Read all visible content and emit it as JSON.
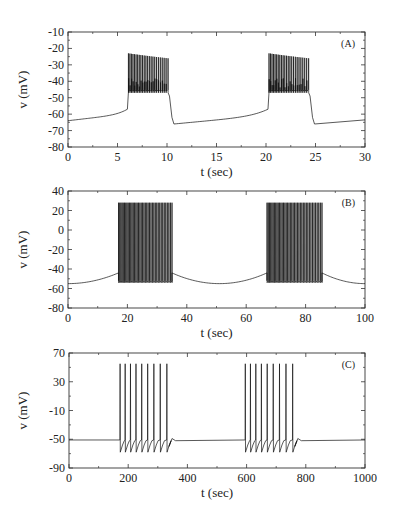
{
  "chart_data": [
    {
      "type": "line",
      "panel_label": "(A)",
      "xlabel": "t (sec)",
      "ylabel": "v (mV)",
      "xlim": [
        0,
        30
      ],
      "ylim": [
        -80,
        -10
      ],
      "xticks": [
        0,
        5,
        10,
        15,
        20,
        25,
        30
      ],
      "yticks": [
        -10,
        -20,
        -30,
        -40,
        -50,
        -60,
        -70,
        -80
      ],
      "grid": false,
      "description": "Bursting membrane potential: slow ramp from -64 mV, bursts of spikes (peaks ~-23 to -26 mV, troughs ~-47 mV) then drop to -66 mV",
      "bursts": [
        {
          "start": 6.1,
          "end": 10.1,
          "spikes": 24,
          "peak": -23,
          "trough": -47
        },
        {
          "start": 20.3,
          "end": 24.3,
          "spikes": 24,
          "peak": -23,
          "trough": -47
        }
      ],
      "baseline": {
        "start_v": -64,
        "post_burst_v": -66,
        "pre_burst_v": -59
      },
      "plot_box": {
        "x0": 68,
        "x1": 365,
        "y0": 32,
        "y1": 147
      }
    },
    {
      "type": "line",
      "panel_label": "(B)",
      "xlabel": "t (sec)",
      "ylabel": "v (mV)",
      "xlim": [
        0,
        100
      ],
      "ylim": [
        -80,
        40
      ],
      "xticks": [
        0,
        20,
        40,
        60,
        80,
        100
      ],
      "yticks": [
        40,
        20,
        0,
        -20,
        -40,
        -60,
        -80
      ],
      "grid": false,
      "description": "Bursting: slow wave between -55 mV and -43 mV with dense spike bursts (peaks ~28 mV, troughs ~-54 mV)",
      "bursts": [
        {
          "start": 17,
          "end": 35,
          "spikes": 40,
          "peak": 28,
          "trough": -54
        },
        {
          "start": 67,
          "end": 85.5,
          "spikes": 40,
          "peak": 28,
          "trough": -54
        }
      ],
      "baseline": {
        "start_v": -55,
        "min_v": -55,
        "pre_burst_v": -44
      },
      "plot_box": {
        "x0": 68,
        "x1": 365,
        "y0": 191,
        "y1": 308
      }
    },
    {
      "type": "line",
      "panel_label": "(C)",
      "xlabel": "t (sec)",
      "ylabel": "v (mV)",
      "xlim": [
        0,
        1000
      ],
      "ylim": [
        -90,
        70
      ],
      "xticks": [
        0,
        200,
        400,
        600,
        800,
        1000
      ],
      "yticks": [
        70,
        30,
        -10,
        -50,
        -90
      ],
      "grid": false,
      "description": "Bursting: flat baseline ~-51 mV, bursts of 9 spikes (peaks ~55 mV, troughs ~-68 mV)",
      "bursts": [
        {
          "start": 172,
          "end": 330,
          "spikes": 9,
          "peak": 55,
          "trough": -68
        },
        {
          "start": 595,
          "end": 755,
          "spikes": 9,
          "peak": 55,
          "trough": -68
        }
      ],
      "baseline": {
        "start_v": -51
      },
      "plot_box": {
        "x0": 69,
        "x1": 365,
        "y0": 353,
        "y1": 468
      }
    }
  ]
}
